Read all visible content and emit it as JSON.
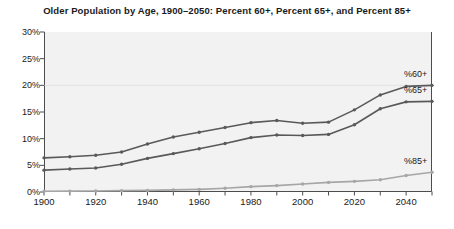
{
  "chart_data": {
    "type": "line",
    "title": "Older Population by Age, 1900–2050: Percent 60+, Percent 65+, and Percent 85+",
    "xlabel": "",
    "ylabel": "",
    "xlim": [
      1900,
      2050
    ],
    "ylim": [
      0,
      30
    ],
    "grid": false,
    "legend_position": "inline-right",
    "x": [
      1900,
      1910,
      1920,
      1930,
      1940,
      1950,
      1960,
      1970,
      1980,
      1990,
      2000,
      2010,
      2020,
      2030,
      2040,
      2050
    ],
    "y_ticks": [
      0,
      5,
      10,
      15,
      20,
      25,
      30
    ],
    "y_tick_labels": [
      "0%",
      "5%",
      "10%",
      "15%",
      "20%",
      "25%",
      "30%"
    ],
    "x_ticks": [
      1900,
      1910,
      1920,
      1930,
      1940,
      1950,
      1960,
      1970,
      1980,
      1990,
      2000,
      2010,
      2020,
      2030,
      2040,
      2050
    ],
    "x_tick_labels_shown": [
      "1900",
      "1920",
      "1940",
      "1960",
      "1980",
      "2000",
      "2020",
      "2040"
    ],
    "x_tick_labels_shown_values": [
      1900,
      1920,
      1940,
      1960,
      1980,
      2000,
      2020,
      2040
    ],
    "series": [
      {
        "name": "%60+",
        "label": "%60+",
        "color": "#595959",
        "values": [
          6.4,
          6.6,
          6.9,
          7.5,
          9.0,
          10.3,
          11.2,
          12.1,
          13.0,
          13.4,
          12.9,
          13.1,
          15.4,
          18.2,
          19.8,
          20.0
        ]
      },
      {
        "name": "%65+",
        "label": "%65+",
        "color": "#595959",
        "values": [
          4.1,
          4.3,
          4.5,
          5.2,
          6.3,
          7.2,
          8.1,
          9.1,
          10.2,
          10.7,
          10.6,
          10.8,
          12.6,
          15.6,
          16.9,
          17.0
        ]
      },
      {
        "name": "%85+",
        "label": "%85+",
        "color": "#a6a6a6",
        "values": [
          0.15,
          0.17,
          0.2,
          0.25,
          0.3,
          0.4,
          0.5,
          0.7,
          1.0,
          1.2,
          1.5,
          1.8,
          2.0,
          2.3,
          3.1,
          3.7
        ]
      }
    ],
    "series_values_as_percent": {
      "note_axis_unit": "percent"
    }
  },
  "axis": {
    "frame_color": "#4d4d4d",
    "plot_background": "#f2f2f2",
    "tick_color": "#4d4d4d"
  }
}
